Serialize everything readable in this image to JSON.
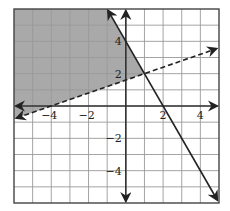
{
  "chart_data": {
    "type": "line",
    "title": "",
    "xlabel": "",
    "ylabel": "",
    "xlim": [
      -6,
      5
    ],
    "ylim": [
      -6,
      6
    ],
    "grid": true,
    "x_ticks_labeled": [
      -4,
      -2,
      2,
      4
    ],
    "y_ticks_labeled": [
      4,
      2,
      -2,
      -4
    ],
    "x_tick_labels": [
      "−4",
      "−2",
      "2",
      "4"
    ],
    "y_tick_labels": [
      "4",
      "2",
      "−2",
      "−4"
    ],
    "series": [
      {
        "name": "solid boundary",
        "equation": "y = -2x + 4",
        "style": "solid",
        "points": [
          [
            -1,
            6
          ],
          [
            5,
            -6
          ]
        ],
        "arrows": "both"
      },
      {
        "name": "dashed boundary",
        "equation": "y = 0.4x + 1.6",
        "style": "dashed",
        "points": [
          [
            -6,
            -0.8
          ],
          [
            5,
            3.6
          ]
        ],
        "arrows": "both"
      }
    ],
    "shaded_region": {
      "description": "y > 0.4x + 1.6 and y <= -2x + 4",
      "vertices": [
        [
          -6,
          6
        ],
        [
          -1,
          6
        ],
        [
          1,
          2
        ],
        [
          -6,
          -0.8
        ]
      ],
      "color": "#a9a9a9"
    },
    "intersection": [
      1,
      2
    ]
  },
  "colors": {
    "background": "#ffffff",
    "grid": "#9a9a9a",
    "grid_shaded": "#8c8c8c",
    "axis": "#333333",
    "line": "#222222",
    "shade": "#a9a9a9"
  }
}
